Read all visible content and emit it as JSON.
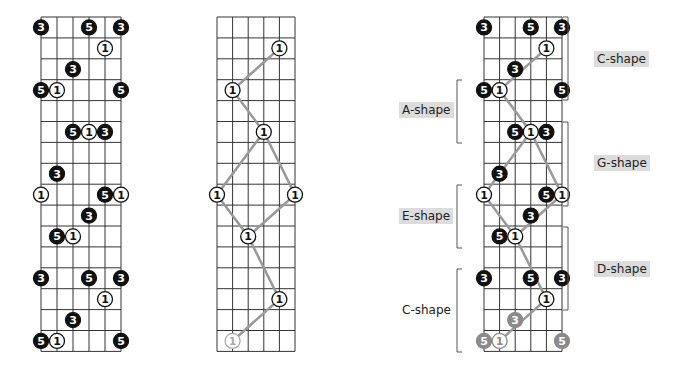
{
  "diagrams": [
    {
      "name": "notes-diagram",
      "x0": 41,
      "y0": 17,
      "string_gap": 16,
      "fret_gap": 20.9,
      "frets": 16,
      "strings": 6,
      "notes": [
        {
          "s": 0,
          "f": 0,
          "l": "3",
          "t": "b"
        },
        {
          "s": 3,
          "f": 0,
          "l": "5",
          "t": "b"
        },
        {
          "s": 5,
          "f": 0,
          "l": "3",
          "t": "b"
        },
        {
          "s": 4,
          "f": 1,
          "l": "1",
          "t": "w"
        },
        {
          "s": 2,
          "f": 2,
          "l": "3",
          "t": "b"
        },
        {
          "s": 0,
          "f": 3,
          "l": "5",
          "t": "b"
        },
        {
          "s": 1,
          "f": 3,
          "l": "1",
          "t": "w"
        },
        {
          "s": 5,
          "f": 3,
          "l": "5",
          "t": "b"
        },
        {
          "s": 2,
          "f": 5,
          "l": "5",
          "t": "b"
        },
        {
          "s": 3,
          "f": 5,
          "l": "1",
          "t": "w"
        },
        {
          "s": 4,
          "f": 5,
          "l": "3",
          "t": "b"
        },
        {
          "s": 1,
          "f": 7,
          "l": "3",
          "t": "b"
        },
        {
          "s": 0,
          "f": 8,
          "l": "1",
          "t": "w"
        },
        {
          "s": 4,
          "f": 8,
          "l": "5",
          "t": "b"
        },
        {
          "s": 5,
          "f": 8,
          "l": "1",
          "t": "w"
        },
        {
          "s": 3,
          "f": 9,
          "l": "3",
          "t": "b"
        },
        {
          "s": 1,
          "f": 10,
          "l": "5",
          "t": "b"
        },
        {
          "s": 2,
          "f": 10,
          "l": "1",
          "t": "w"
        },
        {
          "s": 0,
          "f": 12,
          "l": "3",
          "t": "b"
        },
        {
          "s": 3,
          "f": 12,
          "l": "5",
          "t": "b"
        },
        {
          "s": 5,
          "f": 12,
          "l": "3",
          "t": "b"
        },
        {
          "s": 4,
          "f": 13,
          "l": "1",
          "t": "w"
        },
        {
          "s": 2,
          "f": 14,
          "l": "3",
          "t": "b"
        },
        {
          "s": 0,
          "f": 15,
          "l": "5",
          "t": "b"
        },
        {
          "s": 1,
          "f": 15,
          "l": "1",
          "t": "w"
        },
        {
          "s": 5,
          "f": 15,
          "l": "5",
          "t": "b"
        }
      ],
      "path": []
    },
    {
      "name": "roots-diagram",
      "x0": 217,
      "y0": 17,
      "string_gap": 15.6,
      "fret_gap": 20.9,
      "frets": 16,
      "strings": 6,
      "notes": [
        {
          "s": 4,
          "f": 1,
          "l": "1",
          "t": "w"
        },
        {
          "s": 1,
          "f": 3,
          "l": "1",
          "t": "w"
        },
        {
          "s": 3,
          "f": 5,
          "l": "1",
          "t": "w"
        },
        {
          "s": 0,
          "f": 8,
          "l": "1",
          "t": "w"
        },
        {
          "s": 5,
          "f": 8,
          "l": "1",
          "t": "w"
        },
        {
          "s": 2,
          "f": 10,
          "l": "1",
          "t": "w"
        },
        {
          "s": 4,
          "f": 13,
          "l": "1",
          "t": "w"
        },
        {
          "s": 1,
          "f": 15,
          "l": "1",
          "t": "g"
        }
      ],
      "path": [
        [
          [
            4,
            1
          ],
          [
            1,
            3
          ],
          [
            3,
            5
          ],
          [
            5,
            8
          ],
          [
            2,
            10
          ]
        ],
        [
          [
            3,
            5
          ],
          [
            0,
            8
          ],
          [
            2,
            10
          ],
          [
            4,
            13
          ],
          [
            1,
            15
          ]
        ]
      ]
    },
    {
      "name": "shapes-diagram",
      "x0": 484,
      "y0": 17,
      "string_gap": 15.6,
      "fret_gap": 20.9,
      "frets": 16,
      "strings": 6,
      "notes": [
        {
          "s": 0,
          "f": 0,
          "l": "3",
          "t": "b"
        },
        {
          "s": 3,
          "f": 0,
          "l": "5",
          "t": "b"
        },
        {
          "s": 5,
          "f": 0,
          "l": "3",
          "t": "b"
        },
        {
          "s": 4,
          "f": 1,
          "l": "1",
          "t": "w"
        },
        {
          "s": 2,
          "f": 2,
          "l": "3",
          "t": "b"
        },
        {
          "s": 0,
          "f": 3,
          "l": "5",
          "t": "b"
        },
        {
          "s": 1,
          "f": 3,
          "l": "1",
          "t": "w"
        },
        {
          "s": 5,
          "f": 3,
          "l": "5",
          "t": "b"
        },
        {
          "s": 2,
          "f": 5,
          "l": "5",
          "t": "b"
        },
        {
          "s": 3,
          "f": 5,
          "l": "1",
          "t": "w"
        },
        {
          "s": 4,
          "f": 5,
          "l": "3",
          "t": "b"
        },
        {
          "s": 1,
          "f": 7,
          "l": "3",
          "t": "b"
        },
        {
          "s": 0,
          "f": 8,
          "l": "1",
          "t": "w"
        },
        {
          "s": 4,
          "f": 8,
          "l": "5",
          "t": "b"
        },
        {
          "s": 5,
          "f": 8,
          "l": "1",
          "t": "w"
        },
        {
          "s": 3,
          "f": 9,
          "l": "3",
          "t": "b"
        },
        {
          "s": 1,
          "f": 10,
          "l": "5",
          "t": "b"
        },
        {
          "s": 2,
          "f": 10,
          "l": "1",
          "t": "w"
        },
        {
          "s": 0,
          "f": 12,
          "l": "3",
          "t": "b"
        },
        {
          "s": 3,
          "f": 12,
          "l": "5",
          "t": "b"
        },
        {
          "s": 5,
          "f": 12,
          "l": "3",
          "t": "b"
        },
        {
          "s": 4,
          "f": 13,
          "l": "1",
          "t": "w"
        },
        {
          "s": 2,
          "f": 14,
          "l": "3",
          "t": "g"
        },
        {
          "s": 0,
          "f": 15,
          "l": "5",
          "t": "g"
        },
        {
          "s": 1,
          "f": 15,
          "l": "1",
          "t": "gw"
        },
        {
          "s": 5,
          "f": 15,
          "l": "5",
          "t": "g"
        }
      ],
      "path": [
        [
          [
            4,
            1
          ],
          [
            1,
            3
          ],
          [
            3,
            5
          ],
          [
            5,
            8
          ],
          [
            2,
            10
          ]
        ],
        [
          [
            3,
            5
          ],
          [
            0,
            8
          ],
          [
            2,
            10
          ],
          [
            4,
            13
          ],
          [
            1,
            15
          ]
        ]
      ]
    }
  ],
  "shape_labels": {
    "c_shape_top": "C-shape",
    "a_shape": "A-shape",
    "g_shape": "G-shape",
    "e_shape": "E-shape",
    "d_shape": "D-shape",
    "c_shape_bottom": "C-shape"
  },
  "brackets": [
    {
      "side": "right",
      "x": 568,
      "y1": 17,
      "y2": 100
    },
    {
      "side": "left",
      "x": 457,
      "y1": 80,
      "y2": 143
    },
    {
      "side": "right",
      "x": 568,
      "y1": 122,
      "y2": 206
    },
    {
      "side": "left",
      "x": 457,
      "y1": 185,
      "y2": 248
    },
    {
      "side": "right",
      "x": 568,
      "y1": 227,
      "y2": 310
    },
    {
      "side": "left",
      "x": 457,
      "y1": 269,
      "y2": 352
    }
  ],
  "colors": {
    "grid": "#333333",
    "note_black": "#111111",
    "note_gray": "#8a8a8a",
    "line_gray": "#999999",
    "label_bg": "#dcdcdc"
  }
}
